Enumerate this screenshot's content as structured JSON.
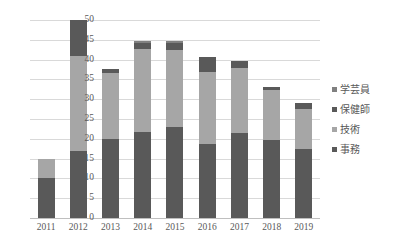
{
  "top_caption": {
    "left_text": "",
    "right_text": ""
  },
  "legend": {
    "position": "right",
    "items": [
      {
        "label": "学芸員",
        "color": "#808080"
      },
      {
        "label": "保健師",
        "color": "#595959"
      },
      {
        "label": "技術",
        "color": "#a6a6a6"
      },
      {
        "label": "事務",
        "color": "#595959"
      }
    ]
  },
  "chart_data": {
    "type": "bar",
    "stacked": true,
    "title": "",
    "subtitle": "",
    "xlabel": "",
    "ylabel": "",
    "ylim": [
      0,
      50
    ],
    "ytick_step": 5,
    "yticks": [
      0,
      5,
      10,
      15,
      20,
      25,
      30,
      35,
      40,
      45,
      50
    ],
    "grid": true,
    "legend_position": "right",
    "categories": [
      "2011",
      "2012",
      "2013",
      "2014",
      "2015",
      "2016",
      "2017",
      "2018",
      "2019"
    ],
    "series": [
      {
        "name": "事務",
        "color": "#595959",
        "values": [
          10,
          17,
          20,
          21.6,
          23,
          18.7,
          21.5,
          19.7,
          17.5
        ]
      },
      {
        "name": "技術",
        "color": "#a6a6a6",
        "values": [
          5,
          24,
          16.6,
          21.2,
          19.4,
          18.1,
          16.4,
          12.6,
          10
        ]
      },
      {
        "name": "保健師",
        "color": "#595959",
        "values": [
          0,
          9,
          1.1,
          1.4,
          1.9,
          3.9,
          1.7,
          0.8,
          1.5
        ]
      },
      {
        "name": "学芸員",
        "color": "#808080",
        "values": [
          0,
          0,
          0,
          0.6,
          0.4,
          0,
          0,
          0,
          0
        ]
      }
    ],
    "totals": [
      15,
      50,
      37.7,
      44.8,
      44.7,
      40.7,
      39.6,
      33.1,
      29
    ]
  }
}
